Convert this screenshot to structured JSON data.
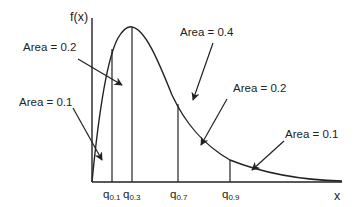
{
  "figure": {
    "y_axis_label": "f(x)",
    "x_axis_label": "x",
    "line_color": "#222222"
  },
  "quantiles": [
    {
      "base": "q",
      "sub": "0.1"
    },
    {
      "base": "q",
      "sub": "0.3"
    },
    {
      "base": "q",
      "sub": "0.7"
    },
    {
      "base": "q",
      "sub": "0.9"
    }
  ],
  "areas": [
    {
      "label": "Area = 0.1",
      "region": "left of q0.1"
    },
    {
      "label": "Area = 0.2",
      "region": "q0.1 to q0.3"
    },
    {
      "label": "Area = 0.4",
      "region": "q0.3 to q0.7"
    },
    {
      "label": "Area = 0.2",
      "region": "q0.7 to q0.9"
    },
    {
      "label": "Area = 0.1",
      "region": "right of q0.9"
    }
  ]
}
